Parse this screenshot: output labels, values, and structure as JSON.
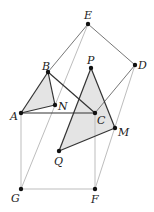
{
  "diagram": {
    "points": {
      "E": {
        "x": 88,
        "y": 24,
        "lx": 84,
        "ly": 19
      },
      "D": {
        "x": 135,
        "y": 65,
        "lx": 138,
        "ly": 69
      },
      "B": {
        "x": 48,
        "y": 72,
        "lx": 42,
        "ly": 70
      },
      "P": {
        "x": 91,
        "y": 68,
        "lx": 87,
        "ly": 64
      },
      "N": {
        "x": 55,
        "y": 105,
        "lx": 58,
        "ly": 110
      },
      "A": {
        "x": 21,
        "y": 113,
        "lx": 10,
        "ly": 120
      },
      "C": {
        "x": 95,
        "y": 113,
        "lx": 97,
        "ly": 124
      },
      "M": {
        "x": 115,
        "y": 128,
        "lx": 118,
        "ly": 136
      },
      "Q": {
        "x": 59,
        "y": 151,
        "lx": 54,
        "ly": 165
      },
      "G": {
        "x": 21,
        "y": 189,
        "lx": 11,
        "ly": 202
      },
      "F": {
        "x": 95,
        "y": 189,
        "lx": 91,
        "ly": 203
      }
    },
    "labels": [
      "A",
      "B",
      "C",
      "D",
      "E",
      "F",
      "G",
      "M",
      "N",
      "P",
      "Q"
    ],
    "colors": {
      "dark": "#333333",
      "medium": "#777777",
      "light": "#bbbbbb",
      "fill": "#e4e4e4"
    }
  }
}
